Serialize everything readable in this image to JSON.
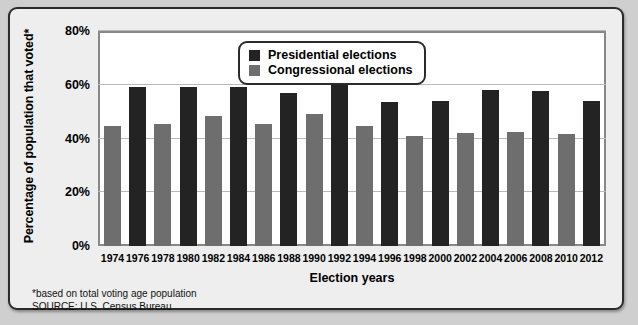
{
  "chart_data": {
    "type": "bar",
    "title": "",
    "xlabel": "Election years",
    "ylabel": "Percentage of population that voted*",
    "ylim": [
      0,
      80
    ],
    "yticks": [
      "0%",
      "20%",
      "40%",
      "60%",
      "80%"
    ],
    "ytick_values": [
      0,
      20,
      40,
      60,
      80
    ],
    "grid": true,
    "legend_position": "top-center",
    "categories": [
      "1974",
      "1976",
      "1978",
      "1980",
      "1982",
      "1984",
      "1986",
      "1988",
      "1990",
      "1992",
      "1994",
      "1996",
      "1998",
      "2000",
      "2002",
      "2004",
      "2006",
      "2008",
      "2010",
      "2012"
    ],
    "series": [
      {
        "name": "Presidential elections",
        "color": "#232323",
        "points": [
          {
            "x": "1976",
            "y": 59
          },
          {
            "x": "1980",
            "y": 59
          },
          {
            "x": "1984",
            "y": 59
          },
          {
            "x": "1988",
            "y": 57
          },
          {
            "x": "1992",
            "y": 61
          },
          {
            "x": "1996",
            "y": 53.5
          },
          {
            "x": "2000",
            "y": 54
          },
          {
            "x": "2004",
            "y": 58
          },
          {
            "x": "2008",
            "y": 57.5
          },
          {
            "x": "2012",
            "y": 54
          }
        ]
      },
      {
        "name": "Congressional elections",
        "color": "#6e6e6e",
        "points": [
          {
            "x": "1974",
            "y": 44.5
          },
          {
            "x": "1978",
            "y": 45.5
          },
          {
            "x": "1982",
            "y": 48.5
          },
          {
            "x": "1986",
            "y": 45.5
          },
          {
            "x": "1990",
            "y": 49
          },
          {
            "x": "1994",
            "y": 44.5
          },
          {
            "x": "1998",
            "y": 41
          },
          {
            "x": "2002",
            "y": 42
          },
          {
            "x": "2006",
            "y": 42.5
          },
          {
            "x": "2010",
            "y": 41.5
          }
        ]
      }
    ],
    "bars": [
      {
        "year": "1974",
        "series": "Congressional elections",
        "value": 44.5
      },
      {
        "year": "1976",
        "series": "Presidential elections",
        "value": 59
      },
      {
        "year": "1978",
        "series": "Congressional elections",
        "value": 45.5
      },
      {
        "year": "1980",
        "series": "Presidential elections",
        "value": 59
      },
      {
        "year": "1982",
        "series": "Congressional elections",
        "value": 48.5
      },
      {
        "year": "1984",
        "series": "Presidential elections",
        "value": 59
      },
      {
        "year": "1986",
        "series": "Congressional elections",
        "value": 45.5
      },
      {
        "year": "1988",
        "series": "Presidential elections",
        "value": 57
      },
      {
        "year": "1990",
        "series": "Congressional elections",
        "value": 49
      },
      {
        "year": "1992",
        "series": "Presidential elections",
        "value": 61
      },
      {
        "year": "1994",
        "series": "Congressional elections",
        "value": 44.5
      },
      {
        "year": "1996",
        "series": "Presidential elections",
        "value": 53.5
      },
      {
        "year": "1998",
        "series": "Congressional elections",
        "value": 41
      },
      {
        "year": "2000",
        "series": "Presidential elections",
        "value": 54
      },
      {
        "year": "2002",
        "series": "Congressional elections",
        "value": 42
      },
      {
        "year": "2004",
        "series": "Presidential elections",
        "value": 58
      },
      {
        "year": "2006",
        "series": "Congressional elections",
        "value": 42.5
      },
      {
        "year": "2008",
        "series": "Presidential elections",
        "value": 57.5
      },
      {
        "year": "2010",
        "series": "Congressional elections",
        "value": 41.5
      },
      {
        "year": "2012",
        "series": "Presidential elections",
        "value": 54
      }
    ]
  },
  "legend": {
    "items": [
      {
        "label": "Presidential elections",
        "color": "#232323",
        "key": "pres"
      },
      {
        "label": "Congressional elections",
        "color": "#6e6e6e",
        "key": "cong"
      }
    ]
  },
  "footnotes": {
    "basis": "*based on total voting age population",
    "source": "SOURCE: U.S. Census Bureau"
  }
}
